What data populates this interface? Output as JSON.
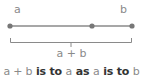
{
  "colors": {
    "line": "#8a8a8a",
    "dot": "#777777",
    "light_text": "#8a8a8a",
    "dark_text": "#333333"
  },
  "labels": {
    "a": "a",
    "b": "b",
    "sum": "a + b"
  },
  "caption": {
    "parts": [
      {
        "text": "a + b",
        "style": "light"
      },
      {
        "text": " is to ",
        "style": "dark"
      },
      {
        "text": "a",
        "style": "light"
      },
      {
        "text": " as ",
        "style": "dark"
      },
      {
        "text": "a",
        "style": "light"
      },
      {
        "text": " is to ",
        "style": "dark"
      },
      {
        "text": "b",
        "style": "light"
      }
    ]
  }
}
